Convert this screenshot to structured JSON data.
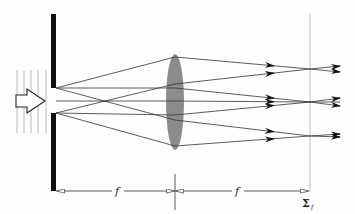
{
  "figure": {
    "type": "optics-ray-diagram",
    "labels": {
      "focal_length_left": "f",
      "focal_length_right": "f",
      "focal_plane": "Σ",
      "focal_plane_subscript": "f"
    },
    "colors": {
      "screen": "#111111",
      "lens": "#8c8c8c",
      "rays": "#333333",
      "wavefronts": "#aaaaaa",
      "focal_plane": "#bbbbbb"
    },
    "geometry": {
      "screen_x": 53,
      "slit_top_y": 88,
      "slit_bottom_y": 113,
      "lens_center": [
        175,
        102
      ],
      "lens_rx": 9,
      "lens_ry": 48,
      "focal_plane_x": 310,
      "image_points_y": [
        69,
        102,
        136
      ]
    }
  }
}
